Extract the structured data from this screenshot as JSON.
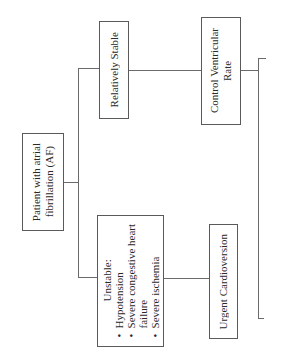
{
  "diagram": {
    "orientation": "rotated-90-ccw",
    "nodes": {
      "root": {
        "label": "Patient with atrial fibrillation (AF)",
        "lines": [
          "Patient with atrial",
          "fibrillation (AF)"
        ]
      },
      "stable": {
        "label": "Relatively Stable"
      },
      "rate": {
        "label": "Control Ventricular Rate",
        "lines": [
          "Control Ventricular",
          "Rate"
        ]
      },
      "unstable": {
        "heading": "Unstable:",
        "criteria": [
          "Hypotension",
          "Severe congestive heart",
          "Severe ischemia"
        ],
        "criteria_continuation": "failure"
      },
      "cardioversion": {
        "label": "Urgent Cardioversion"
      }
    },
    "edges": [
      {
        "from": "root",
        "to": "stable"
      },
      {
        "from": "root",
        "to": "unstable"
      },
      {
        "from": "stable",
        "to": "rate"
      },
      {
        "from": "unstable",
        "to": "cardioversion"
      },
      {
        "from": "rate",
        "to": "bracket"
      }
    ]
  }
}
